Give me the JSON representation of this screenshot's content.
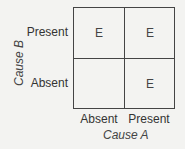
{
  "diagram": {
    "x_axis": {
      "title": "Cause A",
      "labels": [
        "Absent",
        "Present"
      ]
    },
    "y_axis": {
      "title": "Cause B",
      "labels": [
        "Present",
        "Absent"
      ]
    },
    "cells": {
      "present_absent": "E",
      "present_present": "E",
      "absent_absent": "",
      "absent_present": "E"
    }
  }
}
